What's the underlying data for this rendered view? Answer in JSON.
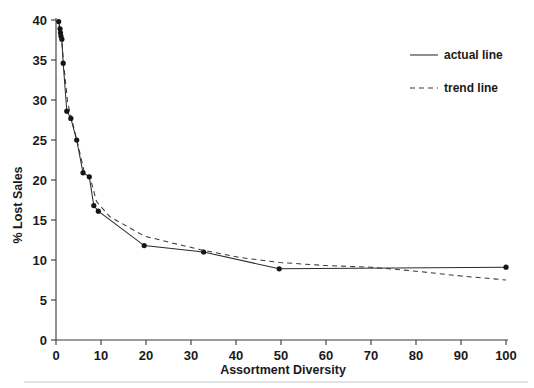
{
  "chart_data": {
    "type": "line",
    "title": "",
    "xlabel": "Assortment Diversity",
    "ylabel": "% Lost Sales",
    "xlim": [
      0,
      100
    ],
    "ylim": [
      0,
      40
    ],
    "xticks": [
      0,
      10,
      20,
      30,
      40,
      50,
      60,
      70,
      80,
      90,
      100
    ],
    "yticks": [
      0,
      5,
      10,
      15,
      20,
      25,
      30,
      35,
      40
    ],
    "xtick_labels": [
      "0",
      "10",
      "20",
      "30",
      "40",
      "50",
      "60",
      "70",
      "80",
      "90",
      "100"
    ],
    "ytick_labels": [
      "0",
      "5",
      "10",
      "15",
      "20",
      "25",
      "30",
      "35",
      "40"
    ],
    "grid": false,
    "legend_position": "upper right",
    "legend_entries": [
      "actual line",
      "trend line"
    ],
    "series": [
      {
        "name": "actual line",
        "style": "solid",
        "markers": true,
        "marker_shape": "circle",
        "color": "#2b2b2b",
        "points": [
          {
            "x": 0.6,
            "y": 39.8
          },
          {
            "x": 0.9,
            "y": 38.9
          },
          {
            "x": 1.0,
            "y": 38.4
          },
          {
            "x": 1.1,
            "y": 38.0
          },
          {
            "x": 1.3,
            "y": 37.6
          },
          {
            "x": 1.6,
            "y": 34.6
          },
          {
            "x": 2.4,
            "y": 28.6
          },
          {
            "x": 3.3,
            "y": 27.7
          },
          {
            "x": 4.6,
            "y": 25.0
          },
          {
            "x": 6.0,
            "y": 20.9
          },
          {
            "x": 7.4,
            "y": 20.4
          },
          {
            "x": 8.4,
            "y": 16.8
          },
          {
            "x": 9.4,
            "y": 16.1
          },
          {
            "x": 19.6,
            "y": 11.8
          },
          {
            "x": 32.8,
            "y": 11.0
          },
          {
            "x": 49.6,
            "y": 8.9
          },
          {
            "x": 100.0,
            "y": 9.1
          }
        ]
      },
      {
        "name": "trend line",
        "style": "dashed",
        "markers": false,
        "color": "#3a3a3a",
        "points": [
          {
            "x": 0.6,
            "y": 39.3
          },
          {
            "x": 1.2,
            "y": 37.8
          },
          {
            "x": 1.8,
            "y": 34.0
          },
          {
            "x": 2.6,
            "y": 29.6
          },
          {
            "x": 3.4,
            "y": 27.8
          },
          {
            "x": 4.8,
            "y": 24.6
          },
          {
            "x": 6.2,
            "y": 21.2
          },
          {
            "x": 7.6,
            "y": 20.3
          },
          {
            "x": 9.0,
            "y": 17.3
          },
          {
            "x": 12.0,
            "y": 15.4
          },
          {
            "x": 19.6,
            "y": 13.0
          },
          {
            "x": 26.0,
            "y": 12.1
          },
          {
            "x": 32.8,
            "y": 11.2
          },
          {
            "x": 41.0,
            "y": 10.3
          },
          {
            "x": 49.6,
            "y": 9.7
          },
          {
            "x": 60.0,
            "y": 9.3
          },
          {
            "x": 70.0,
            "y": 9.1
          },
          {
            "x": 80.0,
            "y": 8.6
          },
          {
            "x": 90.0,
            "y": 8.0
          },
          {
            "x": 100.0,
            "y": 7.5
          }
        ]
      }
    ]
  },
  "legend": {
    "actual_label": "actual line",
    "trend_label": "trend line"
  },
  "axes": {
    "x_title": "Assortment Diversity",
    "y_title": "% Lost Sales"
  }
}
